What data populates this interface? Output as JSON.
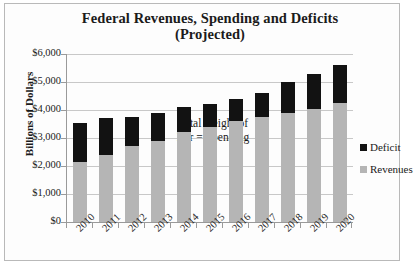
{
  "chart_data": {
    "type": "bar",
    "title": "Federal Revenues, Spending and Deficits (Projected)",
    "title_line1": "Federal Revenues, Spending and Deficits",
    "title_line2": "(Projected)",
    "xlabel": "",
    "ylabel": "Billions of Dollars",
    "ylim": [
      0,
      6000
    ],
    "ytick_values": [
      0,
      1000,
      2000,
      3000,
      4000,
      5000,
      6000
    ],
    "ytick_labels": [
      "$0",
      "$1,000",
      "$2,000",
      "$3,000",
      "$4,000",
      "$5,000",
      "$6,000"
    ],
    "grid": true,
    "stacked": true,
    "legend_position": "right",
    "annotation": "Total Height of Bar = Spending",
    "annotation_line1": "Total Height of",
    "annotation_line2": "Bar = Spending",
    "categories": [
      "2010",
      "2011",
      "2012",
      "2013",
      "2014",
      "2015",
      "2016",
      "2017",
      "2018",
      "2019",
      "2020"
    ],
    "series": [
      {
        "name": "Revenues",
        "color": "#b5b5b5",
        "values": [
          2150,
          2400,
          2700,
          2900,
          3200,
          3400,
          3600,
          3750,
          3900,
          4050,
          4250
        ]
      },
      {
        "name": "Deficit",
        "color": "#121212",
        "values": [
          1400,
          1300,
          1050,
          1000,
          900,
          800,
          800,
          850,
          1100,
          1250,
          1350
        ]
      }
    ],
    "totals_spending": [
      3550,
      3700,
      3750,
      3900,
      4100,
      4200,
      4400,
      4600,
      5000,
      5300,
      5600
    ]
  },
  "legend": {
    "items": [
      {
        "label": "Deficit",
        "color": "#121212"
      },
      {
        "label": "Revenues",
        "color": "#b5b5b5"
      }
    ]
  }
}
